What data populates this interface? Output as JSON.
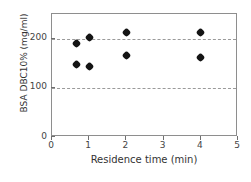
{
  "chart_data": {
    "type": "scatter",
    "title": "",
    "xlabel": "Residence time (min)",
    "ylabel": "BSA DBC10% (mg/ml)",
    "xlim": [
      0,
      5
    ],
    "ylim": [
      0,
      250
    ],
    "xticks": [
      0,
      1,
      2,
      3,
      4,
      5
    ],
    "xtick_labels": [
      "0",
      "1",
      "2",
      "3",
      "4",
      "5"
    ],
    "yticks": [
      0,
      100,
      200
    ],
    "ytick_labels": [
      "0",
      "100",
      "200"
    ],
    "grid": {
      "enabled": true,
      "axis": "y",
      "style": "dashed",
      "values": [
        100,
        200
      ]
    },
    "legend": {
      "visible": false,
      "position": "none"
    },
    "marker": {
      "shape": "diamond",
      "color": "#141414",
      "size": 7
    },
    "series": [
      {
        "name": "BSA DBC10%",
        "points": [
          {
            "x": 0.67,
            "y": 190
          },
          {
            "x": 0.67,
            "y": 148
          },
          {
            "x": 1.0,
            "y": 203
          },
          {
            "x": 1.0,
            "y": 143
          },
          {
            "x": 2.0,
            "y": 212
          },
          {
            "x": 2.0,
            "y": 165
          },
          {
            "x": 4.0,
            "y": 212
          },
          {
            "x": 4.0,
            "y": 162
          }
        ]
      }
    ]
  },
  "colors": {
    "marker": "#141414",
    "frame": "#8e8e8e",
    "gridline": "#9a9a9a",
    "text": "#333333",
    "tick_text": "#444444",
    "background": "#ffffff"
  }
}
